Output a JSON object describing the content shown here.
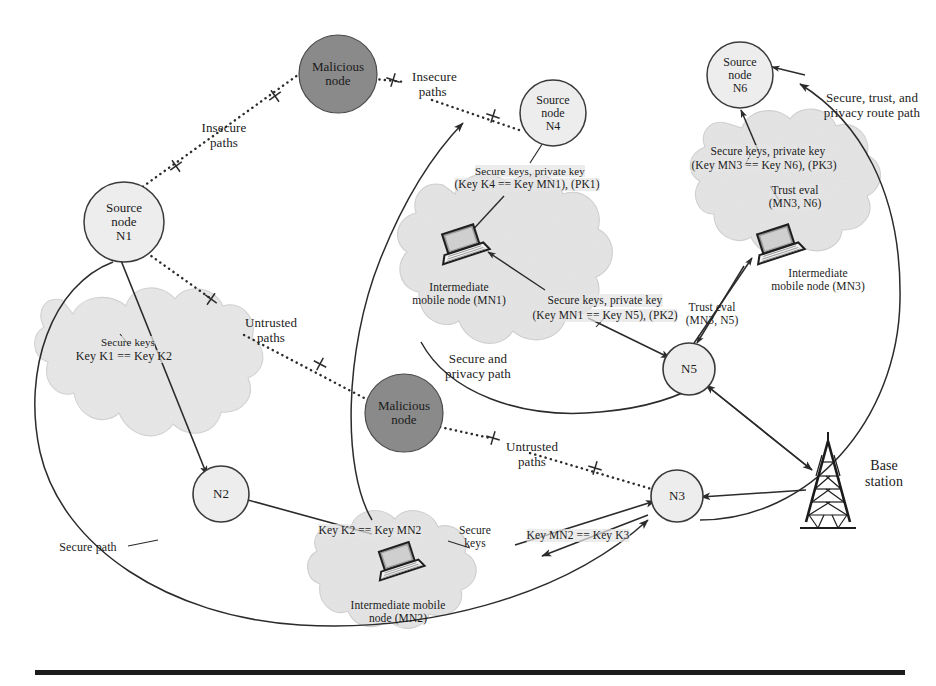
{
  "figure": {
    "colors": {
      "malicious_node_fill": "#8a8a8a",
      "node_fill": "#ededed",
      "cloud_fill": "#e6e6e6",
      "stroke": "#2b2b2b",
      "text": "#1b1b1b",
      "rule": "#1c1c1c"
    }
  },
  "nodes": {
    "n1": {
      "line1": "Source",
      "line2": "node",
      "line3": "N1"
    },
    "n2": {
      "label": "N2"
    },
    "n3": {
      "label": "N3"
    },
    "n4": {
      "line1": "Source",
      "line2": "node",
      "line3": "N4"
    },
    "n5": {
      "label": "N5"
    },
    "n6": {
      "line1": "Source",
      "line2": "node",
      "line3": "N6"
    },
    "malicious_top": {
      "line1": "Malicious",
      "line2": "node"
    },
    "malicious_mid": {
      "line1": "Malicious",
      "line2": "node"
    },
    "base_station": {
      "line1": "Base",
      "line2": "station"
    }
  },
  "clouds": {
    "mn1": {
      "device_label_line1": "Intermediate",
      "device_label_line2": "mobile node (MN1)",
      "key_top_line1": "Secure keys, private key",
      "key_top_line2": "(Key K4 == Key MN1), (PK1)",
      "key_bottom_line1": "Secure keys, private key",
      "key_bottom_line2": "(Key MN1 == Key N5), (PK2)"
    },
    "mn2": {
      "device_label_line1": "Intermediate mobile",
      "device_label_line2": "node (MN2)",
      "secure_keys_line1": "Secure",
      "secure_keys_line2": "keys",
      "key_left": "Key K2 == Key MN2",
      "key_right": "Key MN2 == Key K3"
    },
    "mn3": {
      "device_label_line1": "Intermediate",
      "device_label_line2": "mobile node (MN3)",
      "key_line1": "Secure keys, private key",
      "key_line2": "(Key MN3 == Key N6), (PK3)",
      "trust_top_line1": "Trust eval",
      "trust_top_line2": "(MN3, N6)",
      "trust_bottom_line1": "Trust eval",
      "trust_bottom_line2": "(MN3, N5)"
    },
    "n1n2": {
      "secure_keys": "Secure keys",
      "key_equality": "Key K1 == Key K2"
    }
  },
  "path_labels": {
    "insecure_left_line1": "Insecure",
    "insecure_left_line2": "paths",
    "insecure_right_line1": "Insecure",
    "insecure_right_line2": "paths",
    "untrusted_left_line1": "Untrusted",
    "untrusted_left_line2": "paths",
    "untrusted_right_line1": "Untrusted",
    "untrusted_right_line2": "paths",
    "secure_privacy_line1": "Secure and",
    "secure_privacy_line2": "privacy path",
    "secure_trust_privacy_line1": "Secure, trust, and",
    "secure_trust_privacy_line2": "privacy route path",
    "secure_path": "Secure path"
  }
}
